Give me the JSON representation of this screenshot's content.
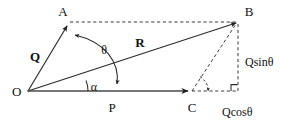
{
  "figure": {
    "background_color": "#ffffff",
    "stroke_color": "#2b2b2b",
    "width": 283,
    "height": 129
  },
  "points": {
    "O": {
      "label": "O",
      "x": 28,
      "y": 91
    },
    "A": {
      "label": "A",
      "x": 68,
      "y": 24
    },
    "B": {
      "label": "B",
      "x": 238,
      "y": 22
    },
    "P": {
      "label": "P",
      "x": 116,
      "y": 91
    },
    "C": {
      "label": "C",
      "x": 192,
      "y": 91
    }
  },
  "vectors": {
    "Q": {
      "label": "Q",
      "from": "O",
      "to": "A"
    },
    "R": {
      "label": "R",
      "from": "O",
      "to": "B"
    },
    "P": {
      "label": "P",
      "from": "O",
      "to": "C"
    }
  },
  "angles": {
    "theta": {
      "label": "θ",
      "between": "OA and OC"
    },
    "alpha": {
      "label": "α",
      "between": "OB and OC"
    },
    "theta_at_C": {
      "label": "",
      "between": "CB and CD"
    }
  },
  "components": {
    "vertical": {
      "label": "Qsinθ"
    },
    "horizontal": {
      "label": "Qcosθ"
    }
  },
  "markers": {
    "right_angle": {
      "label": "right-angle-marker"
    }
  }
}
